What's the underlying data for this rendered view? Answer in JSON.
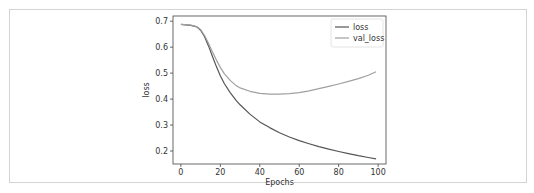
{
  "chart_data": {
    "type": "line",
    "title": "",
    "xlabel": "Epochs",
    "ylabel": "loss",
    "xlim": [
      -4,
      104
    ],
    "ylim": [
      0.15,
      0.72
    ],
    "xticks": [
      0,
      20,
      40,
      60,
      80,
      100
    ],
    "xtick_labels": [
      "0",
      "20",
      "40",
      "60",
      "80",
      "100"
    ],
    "yticks": [
      0.2,
      0.3,
      0.4,
      0.5,
      0.6,
      0.7
    ],
    "ytick_labels": [
      "0.2",
      "0.3",
      "0.4",
      "0.5",
      "0.6",
      "0.7"
    ],
    "grid": false,
    "legend_position": "upper right",
    "x": [
      0,
      5,
      8,
      10,
      12,
      14,
      16,
      18,
      20,
      22,
      25,
      28,
      30,
      35,
      40,
      45,
      50,
      55,
      60,
      65,
      70,
      75,
      80,
      85,
      90,
      95,
      99
    ],
    "series": [
      {
        "name": "loss",
        "color": "#555555",
        "values": [
          0.688,
          0.684,
          0.678,
          0.665,
          0.64,
          0.605,
          0.565,
          0.525,
          0.49,
          0.46,
          0.425,
          0.395,
          0.378,
          0.342,
          0.312,
          0.29,
          0.27,
          0.254,
          0.24,
          0.228,
          0.217,
          0.207,
          0.198,
          0.19,
          0.182,
          0.175,
          0.17
        ]
      },
      {
        "name": "val_loss",
        "color": "#a0a0a0",
        "values": [
          0.688,
          0.685,
          0.679,
          0.668,
          0.645,
          0.615,
          0.582,
          0.55,
          0.522,
          0.498,
          0.472,
          0.452,
          0.443,
          0.43,
          0.422,
          0.419,
          0.419,
          0.421,
          0.425,
          0.432,
          0.44,
          0.449,
          0.458,
          0.468,
          0.479,
          0.492,
          0.505
        ]
      }
    ]
  }
}
